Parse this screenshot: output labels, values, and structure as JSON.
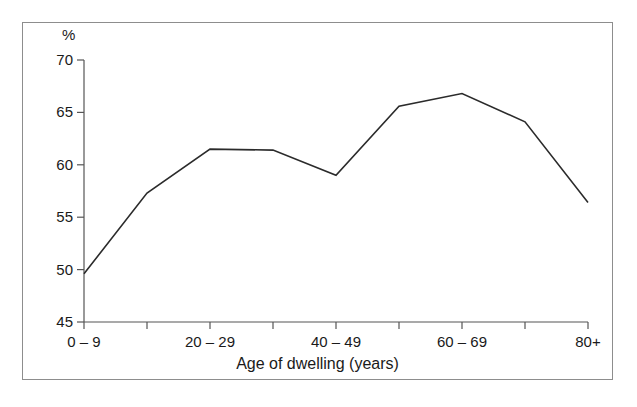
{
  "figure": {
    "background_color": "#ffffff",
    "frame_color": "#8d8d8d",
    "line_color": "#2b2b2b",
    "axis_color": "#555555"
  },
  "axes": {
    "y_unit_label": "%",
    "y_tick_labels": [
      "70",
      "65",
      "60",
      "55",
      "50",
      "45"
    ],
    "x_title": "Age of dwelling (years)",
    "x_tick_labels_visible": [
      "0 – 9",
      "20 – 29",
      "40 – 49",
      "60 – 69",
      "80+"
    ]
  },
  "chart_data": {
    "type": "line",
    "title": "",
    "subtitle": "",
    "xlabel": "Age of dwelling (years)",
    "ylabel": "%",
    "ylim": [
      45,
      70
    ],
    "yticks": [
      45,
      50,
      55,
      60,
      65,
      70
    ],
    "grid": false,
    "legend": false,
    "legend_position": "none",
    "categories": [
      "0 – 9",
      "10 – 19",
      "20 – 29",
      "30 – 39",
      "40 – 49",
      "50 – 59",
      "60 – 69",
      "70 – 79",
      "80+"
    ],
    "labelled_categories": [
      "0 – 9",
      "20 – 29",
      "40 – 49",
      "60 – 69",
      "80+"
    ],
    "values": [
      49.6,
      57.3,
      61.5,
      61.4,
      59.0,
      65.6,
      66.8,
      64.1,
      56.4
    ],
    "annotations": []
  }
}
